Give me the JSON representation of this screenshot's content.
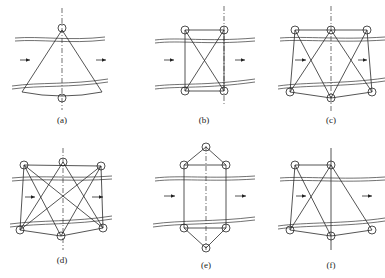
{
  "figure": {
    "panels": [
      {
        "id": "a",
        "label": "(a)",
        "description": "single top node, single bottom node, fan-shaped triangle"
      },
      {
        "id": "b",
        "label": "(b)",
        "description": "two top nodes, two bottom nodes, rectangle with diagonals"
      },
      {
        "id": "c",
        "label": "(c)",
        "description": "three top nodes, three bottom nodes, zigzag bracing"
      },
      {
        "id": "d",
        "label": "(d)",
        "description": "three top nodes, three bottom nodes, full cross bracing"
      },
      {
        "id": "e",
        "label": "(e)",
        "description": "hexagonal arrangement with apex nodes above and below"
      },
      {
        "id": "f",
        "label": "(f)",
        "description": "two top nodes, three bottom nodes, mixed bracing"
      }
    ],
    "flow_direction": "left-to-right",
    "line_color": "#2a2a2a",
    "background": "#ffffff"
  }
}
